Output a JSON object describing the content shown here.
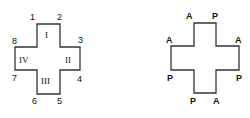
{
  "left_figure": {
    "vertex_labels": [
      "1",
      "2",
      "3",
      "4",
      "5",
      "6",
      "7",
      "8"
    ],
    "region_labels": [
      "I",
      "II",
      "III",
      "IV"
    ]
  },
  "right_figure": {
    "vertex_labels": [
      "A",
      "P",
      "A",
      "P",
      "A",
      "P",
      "P",
      "A"
    ]
  },
  "colors": {
    "stroke": "#333333",
    "text": "#111111",
    "background": "#ffffff"
  }
}
